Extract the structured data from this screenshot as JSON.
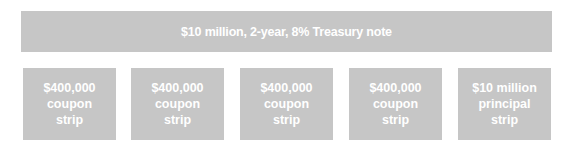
{
  "note": {
    "label": "$10 million, 2-year, 8% Treasury note"
  },
  "strips": [
    {
      "line1": "$400,000",
      "line2": "coupon",
      "line3": "strip"
    },
    {
      "line1": "$400,000",
      "line2": "coupon",
      "line3": "strip"
    },
    {
      "line1": "$400,000",
      "line2": "coupon",
      "line3": "strip"
    },
    {
      "line1": "$400,000",
      "line2": "coupon",
      "line3": "strip"
    },
    {
      "line1": "$10 million",
      "line2": "principal",
      "line3": "strip"
    }
  ],
  "colors": {
    "box_fill": "#c6c6c6",
    "text": "#ffffff",
    "background": "#ffffff"
  }
}
